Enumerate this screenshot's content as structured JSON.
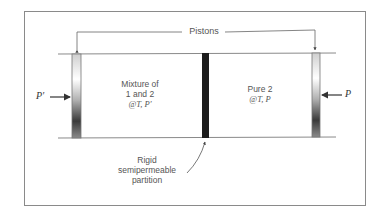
{
  "diagram": {
    "callouts": {
      "pistons": "Pistons",
      "partition_line1": "Rigid",
      "partition_line2": "semipermeable",
      "partition_line3": "partition"
    },
    "left_chamber": {
      "line1": "Mixture of",
      "line2": "1 and 2",
      "line3": "@T, P′"
    },
    "right_chamber": {
      "line1": "Pure 2",
      "line2": "@T, P"
    },
    "pressures": {
      "left": "P′",
      "right": "P"
    },
    "colors": {
      "partition": "#1c1c1c",
      "lines": "#8a8a8a",
      "text": "#555555"
    }
  }
}
